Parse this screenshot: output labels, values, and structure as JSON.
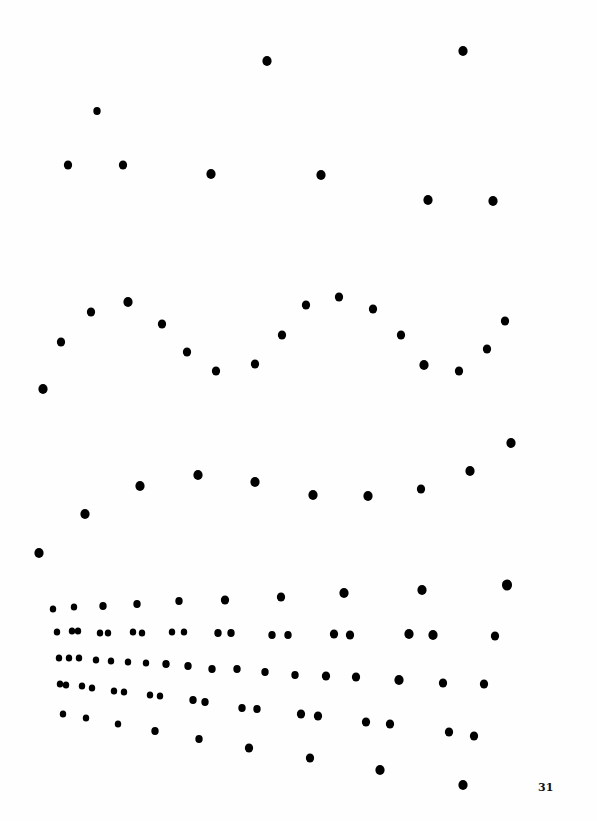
{
  "page": {
    "page_number": "31",
    "ink_color": "#000000",
    "background_color": "#fefefe"
  },
  "figures": [
    {
      "id": "scattered-dots",
      "description": "scattered dots, upper section",
      "dot_count": 10
    },
    {
      "id": "wave-dots",
      "description": "dots tracing a sinusoidal wave",
      "dot_count": 19
    },
    {
      "id": "rising-curve-dots",
      "description": "dots tracing a rising curve",
      "dot_count": 10
    },
    {
      "id": "dot-rows",
      "description": "rows of paired dots fanning outward",
      "dot_count": 61
    }
  ]
}
